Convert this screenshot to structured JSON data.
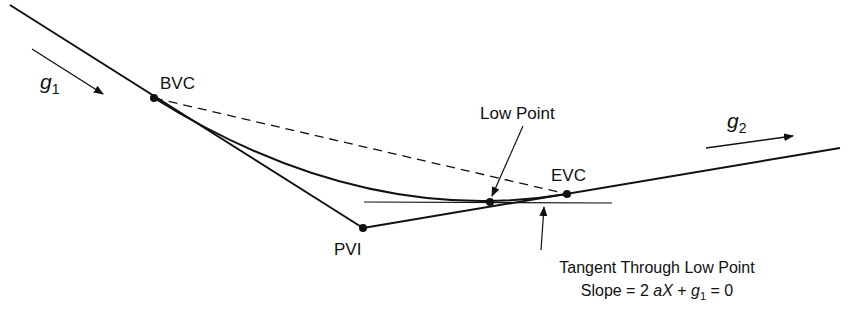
{
  "diagram": {
    "points": {
      "bvc": {
        "label": "BVC",
        "x": 154,
        "y": 98
      },
      "pvi": {
        "label": "PVI",
        "x": 363,
        "y": 228
      },
      "evc": {
        "label": "EVC",
        "x": 567,
        "y": 194
      },
      "low_point": {
        "label": "Low Point",
        "x": 490,
        "y": 202
      }
    },
    "grades": {
      "g1": {
        "symbol": "g",
        "subscript": "1"
      },
      "g2": {
        "symbol": "g",
        "subscript": "2"
      }
    },
    "annotations": {
      "tangent_line1": "Tangent Through Low Point",
      "tangent_line2_prefix": "Slope = 2 ",
      "tangent_line2_aX": "aX",
      "tangent_line2_plus": " + ",
      "tangent_line2_g": "g",
      "tangent_line2_sub": "1",
      "tangent_line2_suffix": " = 0"
    },
    "colors": {
      "ink": "#111111",
      "background": "#ffffff"
    }
  }
}
